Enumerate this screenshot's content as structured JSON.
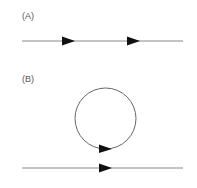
{
  "panels": [
    {
      "label": "(A)",
      "label_pos": {
        "x": 22,
        "y": 11
      },
      "line": {
        "x1": 22,
        "y1": 41,
        "x2": 183,
        "y2": 41
      },
      "arrows": [
        {
          "tip_x": 75,
          "y": 41
        },
        {
          "tip_x": 140,
          "y": 41
        }
      ]
    },
    {
      "label": "(B)",
      "label_pos": {
        "x": 22,
        "y": 74
      },
      "loop": {
        "cx": 105.5,
        "cy": 118.5,
        "r": 30.5,
        "arrow_tip_x": 112,
        "arrow_y": 149
      },
      "line": {
        "x1": 22,
        "y1": 168,
        "x2": 183,
        "y2": 168
      },
      "arrows": [
        {
          "tip_x": 112,
          "y": 168
        }
      ]
    }
  ],
  "colors": {
    "line": "#8a8a8a",
    "arrow": "#111111",
    "label": "#555555"
  }
}
